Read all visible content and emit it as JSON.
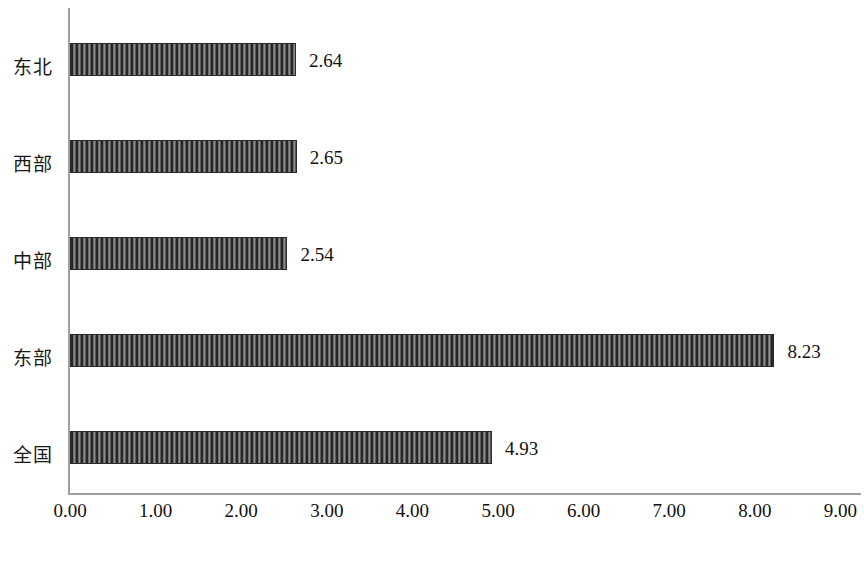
{
  "chart_data": {
    "type": "bar",
    "orientation": "horizontal",
    "title": "",
    "xlabel": "",
    "ylabel": "",
    "categories": [
      "东北",
      "西部",
      "中部",
      "东部",
      "全国"
    ],
    "values": [
      2.64,
      2.65,
      2.54,
      8.23,
      4.93
    ],
    "value_labels": [
      "2.64",
      "2.65",
      "2.54",
      "8.23",
      "4.93"
    ],
    "xlim": [
      0,
      9
    ],
    "xticks": [
      0,
      1,
      2,
      3,
      4,
      5,
      6,
      7,
      8,
      9
    ],
    "xtick_labels": [
      "0.00",
      "1.00",
      "2.00",
      "3.00",
      "4.00",
      "5.00",
      "6.00",
      "7.00",
      "8.00",
      "9.00"
    ],
    "grid": false,
    "legend": null,
    "series": [
      {
        "name": "",
        "values": [
          2.64,
          2.65,
          2.54,
          8.23,
          4.93
        ]
      }
    ],
    "bar_fill": "#4a4a4a",
    "bar_pattern": "vertical-hatch",
    "axis_color": "#a0a0a0",
    "text_color": "#111111"
  },
  "caption": {
    "text": ""
  }
}
